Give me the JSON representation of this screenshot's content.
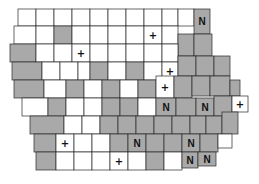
{
  "map": {
    "subject": "Iowa counties",
    "colors": {
      "shaded": "#a9a9a9",
      "plain": "#ffffff",
      "border": "#2a2a2a"
    },
    "symbols": {
      "N": "N",
      "plus": "+"
    },
    "counties": [
      {
        "x": 18,
        "y": 9,
        "w": 18,
        "h": 17,
        "shaded": false
      },
      {
        "x": 36,
        "y": 9,
        "w": 18,
        "h": 17,
        "shaded": false
      },
      {
        "x": 54,
        "y": 9,
        "w": 18,
        "h": 17,
        "shaded": false
      },
      {
        "x": 72,
        "y": 9,
        "w": 18,
        "h": 17,
        "shaded": false
      },
      {
        "x": 90,
        "y": 9,
        "w": 18,
        "h": 17,
        "shaded": false
      },
      {
        "x": 108,
        "y": 9,
        "w": 18,
        "h": 17,
        "shaded": false
      },
      {
        "x": 126,
        "y": 9,
        "w": 18,
        "h": 17,
        "shaded": false
      },
      {
        "x": 144,
        "y": 9,
        "w": 18,
        "h": 17,
        "shaded": false
      },
      {
        "x": 162,
        "y": 9,
        "w": 16,
        "h": 17,
        "shaded": false
      },
      {
        "x": 178,
        "y": 9,
        "w": 16,
        "h": 17,
        "shaded": false
      },
      {
        "x": 194,
        "y": 9,
        "w": 16,
        "h": 25,
        "shaded": true,
        "mark": "N"
      },
      {
        "x": 14,
        "y": 26,
        "w": 22,
        "h": 18,
        "shaded": false
      },
      {
        "x": 36,
        "y": 26,
        "w": 18,
        "h": 18,
        "shaded": false
      },
      {
        "x": 54,
        "y": 26,
        "w": 18,
        "h": 18,
        "shaded": true
      },
      {
        "x": 72,
        "y": 26,
        "w": 18,
        "h": 18,
        "shaded": false
      },
      {
        "x": 90,
        "y": 26,
        "w": 18,
        "h": 18,
        "shaded": false
      },
      {
        "x": 108,
        "y": 26,
        "w": 18,
        "h": 18,
        "shaded": false
      },
      {
        "x": 126,
        "y": 26,
        "w": 18,
        "h": 18,
        "shaded": false
      },
      {
        "x": 144,
        "y": 26,
        "w": 18,
        "h": 18,
        "shaded": false,
        "mark": "+"
      },
      {
        "x": 162,
        "y": 26,
        "w": 16,
        "h": 18,
        "shaded": false
      },
      {
        "x": 178,
        "y": 34,
        "w": 16,
        "h": 22,
        "shaded": true
      },
      {
        "x": 194,
        "y": 34,
        "w": 18,
        "h": 22,
        "shaded": true
      },
      {
        "x": 10,
        "y": 44,
        "w": 26,
        "h": 18,
        "shaded": true
      },
      {
        "x": 36,
        "y": 44,
        "w": 18,
        "h": 18,
        "shaded": false
      },
      {
        "x": 54,
        "y": 44,
        "w": 18,
        "h": 18,
        "shaded": false
      },
      {
        "x": 72,
        "y": 44,
        "w": 18,
        "h": 18,
        "shaded": false,
        "mark": "+"
      },
      {
        "x": 90,
        "y": 44,
        "w": 18,
        "h": 18,
        "shaded": false
      },
      {
        "x": 108,
        "y": 44,
        "w": 18,
        "h": 18,
        "shaded": false
      },
      {
        "x": 126,
        "y": 44,
        "w": 18,
        "h": 18,
        "shaded": false
      },
      {
        "x": 144,
        "y": 44,
        "w": 18,
        "h": 18,
        "shaded": false
      },
      {
        "x": 162,
        "y": 44,
        "w": 16,
        "h": 18,
        "shaded": false
      },
      {
        "x": 12,
        "y": 62,
        "w": 30,
        "h": 18,
        "shaded": true
      },
      {
        "x": 42,
        "y": 62,
        "w": 18,
        "h": 18,
        "shaded": false
      },
      {
        "x": 60,
        "y": 62,
        "w": 18,
        "h": 18,
        "shaded": false
      },
      {
        "x": 78,
        "y": 62,
        "w": 12,
        "h": 18,
        "shaded": false
      },
      {
        "x": 90,
        "y": 62,
        "w": 18,
        "h": 18,
        "shaded": true
      },
      {
        "x": 108,
        "y": 62,
        "w": 18,
        "h": 18,
        "shaded": false
      },
      {
        "x": 126,
        "y": 62,
        "w": 18,
        "h": 18,
        "shaded": true
      },
      {
        "x": 144,
        "y": 62,
        "w": 18,
        "h": 18,
        "shaded": false
      },
      {
        "x": 162,
        "y": 62,
        "w": 16,
        "h": 18,
        "shaded": false,
        "mark": "+"
      },
      {
        "x": 178,
        "y": 56,
        "w": 18,
        "h": 20,
        "shaded": true
      },
      {
        "x": 196,
        "y": 56,
        "w": 18,
        "h": 20,
        "shaded": true
      },
      {
        "x": 214,
        "y": 56,
        "w": 16,
        "h": 20,
        "shaded": true
      },
      {
        "x": 14,
        "y": 80,
        "w": 30,
        "h": 18,
        "shaded": true
      },
      {
        "x": 44,
        "y": 80,
        "w": 22,
        "h": 18,
        "shaded": false
      },
      {
        "x": 66,
        "y": 80,
        "w": 18,
        "h": 18,
        "shaded": true
      },
      {
        "x": 84,
        "y": 80,
        "w": 18,
        "h": 18,
        "shaded": false
      },
      {
        "x": 102,
        "y": 80,
        "w": 18,
        "h": 18,
        "shaded": true
      },
      {
        "x": 120,
        "y": 80,
        "w": 18,
        "h": 18,
        "shaded": false
      },
      {
        "x": 138,
        "y": 80,
        "w": 18,
        "h": 18,
        "shaded": true
      },
      {
        "x": 156,
        "y": 76,
        "w": 18,
        "h": 22,
        "shaded": false,
        "mark": "+"
      },
      {
        "x": 174,
        "y": 76,
        "w": 18,
        "h": 22,
        "shaded": true
      },
      {
        "x": 192,
        "y": 76,
        "w": 18,
        "h": 20,
        "shaded": true
      },
      {
        "x": 210,
        "y": 76,
        "w": 20,
        "h": 20,
        "shaded": true
      },
      {
        "x": 230,
        "y": 80,
        "w": 10,
        "h": 16,
        "shaded": true
      },
      {
        "x": 22,
        "y": 98,
        "w": 26,
        "h": 18,
        "shaded": false
      },
      {
        "x": 48,
        "y": 98,
        "w": 18,
        "h": 18,
        "shaded": true
      },
      {
        "x": 66,
        "y": 98,
        "w": 18,
        "h": 18,
        "shaded": false
      },
      {
        "x": 84,
        "y": 98,
        "w": 18,
        "h": 18,
        "shaded": false
      },
      {
        "x": 102,
        "y": 98,
        "w": 18,
        "h": 18,
        "shaded": true
      },
      {
        "x": 120,
        "y": 98,
        "w": 18,
        "h": 18,
        "shaded": true
      },
      {
        "x": 138,
        "y": 98,
        "w": 18,
        "h": 18,
        "shaded": false
      },
      {
        "x": 156,
        "y": 98,
        "w": 20,
        "h": 18,
        "shaded": true,
        "mark": "N"
      },
      {
        "x": 176,
        "y": 98,
        "w": 20,
        "h": 18,
        "shaded": true
      },
      {
        "x": 196,
        "y": 98,
        "w": 18,
        "h": 18,
        "shaded": true,
        "mark": "N"
      },
      {
        "x": 214,
        "y": 96,
        "w": 18,
        "h": 20,
        "shaded": true
      },
      {
        "x": 232,
        "y": 96,
        "w": 16,
        "h": 16,
        "shaded": false,
        "mark": "+"
      },
      {
        "x": 30,
        "y": 116,
        "w": 34,
        "h": 18,
        "shaded": true
      },
      {
        "x": 64,
        "y": 116,
        "w": 18,
        "h": 18,
        "shaded": false
      },
      {
        "x": 82,
        "y": 116,
        "w": 18,
        "h": 18,
        "shaded": false
      },
      {
        "x": 100,
        "y": 116,
        "w": 18,
        "h": 18,
        "shaded": true
      },
      {
        "x": 118,
        "y": 116,
        "w": 18,
        "h": 18,
        "shaded": true
      },
      {
        "x": 136,
        "y": 116,
        "w": 18,
        "h": 18,
        "shaded": true
      },
      {
        "x": 154,
        "y": 116,
        "w": 18,
        "h": 18,
        "shaded": true
      },
      {
        "x": 172,
        "y": 116,
        "w": 18,
        "h": 18,
        "shaded": true
      },
      {
        "x": 190,
        "y": 116,
        "w": 16,
        "h": 18,
        "shaded": true
      },
      {
        "x": 206,
        "y": 116,
        "w": 16,
        "h": 18,
        "shaded": true
      },
      {
        "x": 222,
        "y": 112,
        "w": 16,
        "h": 22,
        "shaded": true
      },
      {
        "x": 34,
        "y": 134,
        "w": 22,
        "h": 18,
        "shaded": true
      },
      {
        "x": 56,
        "y": 134,
        "w": 18,
        "h": 18,
        "shaded": false,
        "mark": "+"
      },
      {
        "x": 74,
        "y": 134,
        "w": 18,
        "h": 18,
        "shaded": false
      },
      {
        "x": 92,
        "y": 134,
        "w": 18,
        "h": 18,
        "shaded": false
      },
      {
        "x": 110,
        "y": 134,
        "w": 18,
        "h": 18,
        "shaded": true
      },
      {
        "x": 128,
        "y": 134,
        "w": 18,
        "h": 18,
        "shaded": true,
        "mark": "N"
      },
      {
        "x": 146,
        "y": 134,
        "w": 18,
        "h": 18,
        "shaded": true
      },
      {
        "x": 164,
        "y": 134,
        "w": 18,
        "h": 18,
        "shaded": true
      },
      {
        "x": 182,
        "y": 134,
        "w": 18,
        "h": 18,
        "shaded": true,
        "mark": "N"
      },
      {
        "x": 200,
        "y": 134,
        "w": 18,
        "h": 18,
        "shaded": true
      },
      {
        "x": 218,
        "y": 134,
        "w": 14,
        "h": 14,
        "shaded": false
      },
      {
        "x": 36,
        "y": 152,
        "w": 20,
        "h": 18,
        "shaded": true
      },
      {
        "x": 56,
        "y": 152,
        "w": 18,
        "h": 18,
        "shaded": false
      },
      {
        "x": 74,
        "y": 152,
        "w": 18,
        "h": 18,
        "shaded": false
      },
      {
        "x": 92,
        "y": 152,
        "w": 18,
        "h": 18,
        "shaded": false
      },
      {
        "x": 110,
        "y": 152,
        "w": 18,
        "h": 18,
        "shaded": false,
        "mark": "+"
      },
      {
        "x": 128,
        "y": 152,
        "w": 18,
        "h": 18,
        "shaded": false
      },
      {
        "x": 146,
        "y": 152,
        "w": 18,
        "h": 18,
        "shaded": true
      },
      {
        "x": 164,
        "y": 152,
        "w": 18,
        "h": 18,
        "shaded": false
      },
      {
        "x": 182,
        "y": 152,
        "w": 16,
        "h": 16,
        "shaded": true,
        "mark": "N"
      },
      {
        "x": 198,
        "y": 152,
        "w": 18,
        "h": 14,
        "shaded": true,
        "mark": "N"
      }
    ]
  }
}
